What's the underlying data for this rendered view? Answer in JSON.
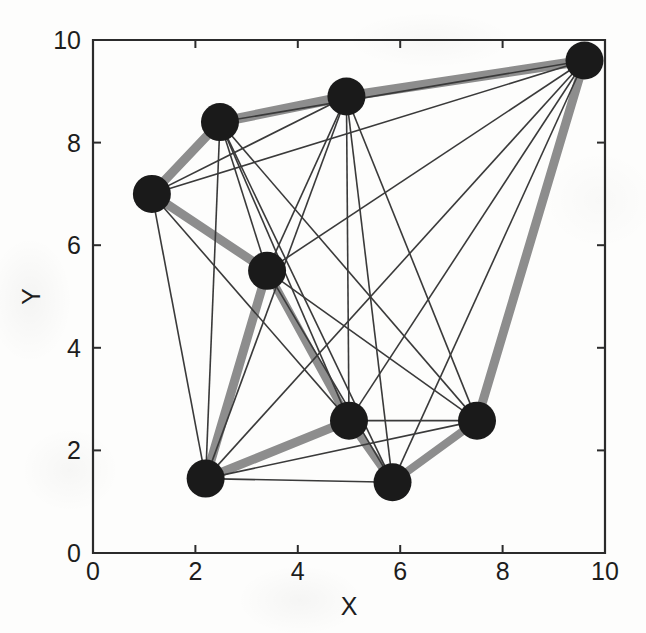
{
  "figure": {
    "kind": "network-graph-plot",
    "background_color": "#fdfdfc",
    "axis_color": "#2b2b2b",
    "node_color": "#1a1a1a",
    "thin_edge_color": "#3a3a3a",
    "thick_edge_color": "#8d8d8d"
  },
  "axes": {
    "x_title": "X",
    "y_title": "Y",
    "x_ticks": [
      "0",
      "2",
      "4",
      "6",
      "8",
      "10"
    ],
    "y_ticks": [
      "0",
      "2",
      "4",
      "6",
      "8",
      "10"
    ],
    "x_tick_values": [
      0,
      2,
      4,
      6,
      8,
      10
    ],
    "y_tick_values": [
      0,
      2,
      4,
      6,
      8,
      10
    ],
    "xlim": [
      0,
      10
    ],
    "ylim": [
      0,
      10
    ],
    "box_left_px": 93,
    "box_top_px": 40,
    "box_right_px": 605,
    "box_bottom_px": 553
  },
  "chart_data": {
    "type": "scatter",
    "title": "",
    "xlabel": "X",
    "ylabel": "Y",
    "xlim": [
      0,
      10
    ],
    "ylim": [
      0,
      10
    ],
    "grid": false,
    "legend": "none",
    "node_radius_px": 19,
    "nodes": [
      {
        "id": 0,
        "label": "n1",
        "x": 1.15,
        "y": 7.0
      },
      {
        "id": 1,
        "label": "n2",
        "x": 2.48,
        "y": 8.4
      },
      {
        "id": 2,
        "label": "n3",
        "x": 4.95,
        "y": 8.9
      },
      {
        "id": 3,
        "label": "n4",
        "x": 9.6,
        "y": 9.6
      },
      {
        "id": 4,
        "label": "n5",
        "x": 3.4,
        "y": 5.5
      },
      {
        "id": 5,
        "label": "n6",
        "x": 2.2,
        "y": 1.45
      },
      {
        "id": 6,
        "label": "n7",
        "x": 5.0,
        "y": 2.58
      },
      {
        "id": 7,
        "label": "n8",
        "x": 5.85,
        "y": 1.38
      },
      {
        "id": 8,
        "label": "n9",
        "x": 7.5,
        "y": 2.58
      }
    ],
    "edges": [
      {
        "source": 0,
        "target": 1,
        "weight": 9,
        "width_px": 9
      },
      {
        "source": 1,
        "target": 2,
        "weight": 10,
        "width_px": 10
      },
      {
        "source": 2,
        "target": 3,
        "weight": 10,
        "width_px": 10
      },
      {
        "source": 0,
        "target": 4,
        "weight": 9,
        "width_px": 9
      },
      {
        "source": 3,
        "target": 8,
        "weight": 9,
        "width_px": 9
      },
      {
        "source": 4,
        "target": 5,
        "weight": 9,
        "width_px": 9
      },
      {
        "source": 4,
        "target": 6,
        "weight": 8,
        "width_px": 8
      },
      {
        "source": 5,
        "target": 6,
        "weight": 9,
        "width_px": 9
      },
      {
        "source": 6,
        "target": 7,
        "weight": 8,
        "width_px": 8
      },
      {
        "source": 7,
        "target": 8,
        "weight": 8,
        "width_px": 8
      },
      {
        "source": 0,
        "target": 2,
        "weight": 1,
        "width_px": 1.6
      },
      {
        "source": 0,
        "target": 3,
        "weight": 1,
        "width_px": 1.6
      },
      {
        "source": 0,
        "target": 5,
        "weight": 1,
        "width_px": 1.6
      },
      {
        "source": 0,
        "target": 6,
        "weight": 1,
        "width_px": 1.6
      },
      {
        "source": 1,
        "target": 3,
        "weight": 1,
        "width_px": 1.6
      },
      {
        "source": 1,
        "target": 4,
        "weight": 1,
        "width_px": 1.6
      },
      {
        "source": 1,
        "target": 5,
        "weight": 1,
        "width_px": 1.6
      },
      {
        "source": 1,
        "target": 6,
        "weight": 1,
        "width_px": 1.6
      },
      {
        "source": 1,
        "target": 7,
        "weight": 1,
        "width_px": 1.6
      },
      {
        "source": 1,
        "target": 8,
        "weight": 1,
        "width_px": 1.6
      },
      {
        "source": 2,
        "target": 4,
        "weight": 1,
        "width_px": 1.6
      },
      {
        "source": 2,
        "target": 5,
        "weight": 1,
        "width_px": 1.6
      },
      {
        "source": 2,
        "target": 6,
        "weight": 1,
        "width_px": 1.6
      },
      {
        "source": 2,
        "target": 7,
        "weight": 1,
        "width_px": 1.6
      },
      {
        "source": 2,
        "target": 8,
        "weight": 1,
        "width_px": 1.6
      },
      {
        "source": 3,
        "target": 4,
        "weight": 1,
        "width_px": 1.6
      },
      {
        "source": 3,
        "target": 5,
        "weight": 1,
        "width_px": 1.6
      },
      {
        "source": 3,
        "target": 6,
        "weight": 1,
        "width_px": 1.6
      },
      {
        "source": 3,
        "target": 7,
        "weight": 1,
        "width_px": 1.6
      },
      {
        "source": 4,
        "target": 7,
        "weight": 1,
        "width_px": 1.6
      },
      {
        "source": 4,
        "target": 8,
        "weight": 1,
        "width_px": 1.6
      },
      {
        "source": 5,
        "target": 7,
        "weight": 1,
        "width_px": 1.6
      },
      {
        "source": 5,
        "target": 8,
        "weight": 1,
        "width_px": 1.6
      },
      {
        "source": 6,
        "target": 8,
        "weight": 1,
        "width_px": 1.6
      }
    ]
  }
}
